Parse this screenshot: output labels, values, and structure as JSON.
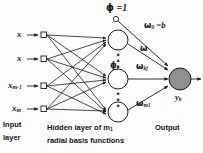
{
  "figure": {
    "background_color": "#fdfdfd",
    "line_color": "#222222",
    "output_node_fill": "#8f8f8f",
    "hidden_node_fill": "#ffffff"
  },
  "inputs": [
    {
      "label": "x",
      "sub": ""
    },
    {
      "label": "x",
      "sub": ""
    },
    {
      "label": "x",
      "sub": "m-1"
    },
    {
      "label": "x",
      "sub": "m"
    }
  ],
  "bias": {
    "symbol": "ϕ",
    "equals": " =1"
  },
  "hidden": {
    "phi_symbol": "ϕ",
    "phi_sub": "j",
    "vertical_dots": "•\n•\n•"
  },
  "weights": [
    {
      "symbol": "ω",
      "sub": "0",
      "equals": " =b"
    },
    {
      "symbol": "ω",
      "sub": "",
      "equals": ""
    },
    {
      "symbol": "ω",
      "sub": "kj",
      "equals": ""
    },
    {
      "symbol": "ω",
      "sub": "m1",
      "equals": ""
    }
  ],
  "output": {
    "symbol": "y",
    "sub": "k"
  },
  "captions": {
    "input_line1": "Input",
    "input_line2": "layer",
    "hidden_line1": "Hidden layer of m",
    "hidden_line1_sub": "1",
    "hidden_line2": "radial basis functions",
    "output": "Output"
  }
}
